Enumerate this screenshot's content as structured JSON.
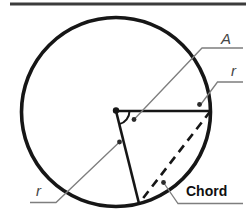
{
  "figure": {
    "labels": {
      "angle": "A",
      "radius_right": "r",
      "radius_left": "r",
      "chord": "Chord"
    },
    "colors": {
      "background": "#ffffff",
      "shape": "#161616",
      "leader": "#7e7e7e",
      "label": "#464646",
      "chord_label": "#101010",
      "dot": "#2b2b2b",
      "top_rule": "#3c3c3c"
    }
  }
}
